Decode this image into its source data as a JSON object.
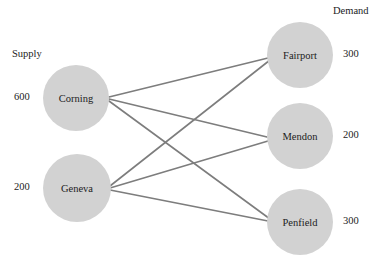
{
  "diagram": {
    "title_supply_header": "Supply",
    "title_demand_header": "Demand",
    "canvas": {
      "width": 376,
      "height": 266,
      "background": "#ffffff"
    },
    "style": {
      "node_fill": "#d2d2d2",
      "edge_color": "#7d7d7d",
      "text_color": "#1c1c1c"
    },
    "supply_nodes": [
      {
        "id": "corning",
        "label": "Corning",
        "amount": "600",
        "cx": 76,
        "cy": 98,
        "r": 33,
        "amount_x": 14,
        "amount_y": 92
      },
      {
        "id": "geneva",
        "label": "Geneva",
        "amount": "200",
        "cx": 77,
        "cy": 188,
        "r": 34,
        "amount_x": 14,
        "amount_y": 182
      }
    ],
    "demand_nodes": [
      {
        "id": "fairport",
        "label": "Fairport",
        "amount": "300",
        "cx": 300,
        "cy": 55,
        "r": 33,
        "amount_x": 343,
        "amount_y": 49
      },
      {
        "id": "mendon",
        "label": "Mendon",
        "amount": "200",
        "cx": 300,
        "cy": 136,
        "r": 33,
        "amount_x": 343,
        "amount_y": 130
      },
      {
        "id": "penfield",
        "label": "Penfield",
        "amount": "300",
        "cx": 300,
        "cy": 222,
        "r": 33,
        "amount_x": 343,
        "amount_y": 216
      }
    ],
    "edges": [
      {
        "from": "corning",
        "to": "fairport",
        "x1": 109,
        "y1": 97,
        "x2": 268,
        "y2": 58
      },
      {
        "from": "corning",
        "to": "mendon",
        "x1": 109,
        "y1": 99,
        "x2": 267,
        "y2": 137
      },
      {
        "from": "corning",
        "to": "penfield",
        "x1": 109,
        "y1": 101,
        "x2": 270,
        "y2": 219
      },
      {
        "from": "geneva",
        "to": "fairport",
        "x1": 110,
        "y1": 186,
        "x2": 270,
        "y2": 60
      },
      {
        "from": "geneva",
        "to": "mendon",
        "x1": 110,
        "y1": 188,
        "x2": 268,
        "y2": 141
      },
      {
        "from": "geneva",
        "to": "penfield",
        "x1": 110,
        "y1": 190,
        "x2": 268,
        "y2": 221
      }
    ],
    "headers": {
      "supply_x": 12,
      "supply_y": 49,
      "demand_x": 333,
      "demand_y": 6
    }
  }
}
